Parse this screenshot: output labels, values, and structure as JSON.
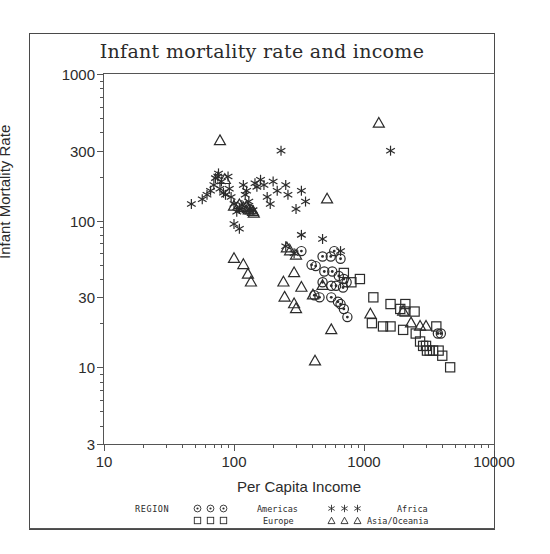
{
  "chart_data": {
    "type": "scatter",
    "title": "Infant mortality rate and income",
    "xlabel": "Per Capita Income",
    "ylabel": "Infant Mortality Rate",
    "xscale": "log",
    "yscale": "log",
    "xlim": [
      10,
      10000
    ],
    "ylim": [
      3,
      1000
    ],
    "xticks": [
      "10",
      "100",
      "1000",
      "10000"
    ],
    "xtick_values": [
      10,
      100,
      1000,
      10000
    ],
    "yticks": [
      "1000",
      "300",
      "100",
      "30",
      "10",
      "3"
    ],
    "ytick_values": [
      1000,
      300,
      100,
      30,
      10,
      3
    ],
    "grid": false,
    "legend_position": "below-axes",
    "legend_title": "REGION",
    "series": [
      {
        "name": "Americas",
        "marker": "circle-dot",
        "points": [
          [
            480,
            57
          ],
          [
            555,
            57
          ],
          [
            660,
            55
          ],
          [
            425,
            49
          ],
          [
            495,
            45
          ],
          [
            570,
            45
          ],
          [
            640,
            42
          ],
          [
            700,
            40
          ],
          [
            735,
            38
          ],
          [
            560,
            36
          ],
          [
            610,
            36
          ],
          [
            690,
            35
          ],
          [
            415,
            31
          ],
          [
            455,
            30
          ],
          [
            560,
            30
          ],
          [
            630,
            28
          ],
          [
            660,
            27
          ],
          [
            700,
            25
          ],
          [
            745,
            22
          ],
          [
            3700,
            17
          ],
          [
            3900,
            17
          ],
          [
            330,
            62
          ],
          [
            395,
            50
          ],
          [
            480,
            38
          ],
          [
            590,
            62
          ]
        ]
      },
      {
        "name": "Europe",
        "marker": "square",
        "points": [
          [
            1180,
            30
          ],
          [
            1600,
            27
          ],
          [
            1900,
            25
          ],
          [
            2050,
            24
          ],
          [
            2450,
            24
          ],
          [
            1400,
            19
          ],
          [
            1600,
            19
          ],
          [
            2000,
            18
          ],
          [
            2500,
            17
          ],
          [
            2700,
            15
          ],
          [
            2850,
            14
          ],
          [
            3000,
            14
          ],
          [
            3050,
            13
          ],
          [
            3200,
            13
          ],
          [
            3400,
            13
          ],
          [
            3600,
            19
          ],
          [
            3750,
            13
          ],
          [
            4000,
            12
          ],
          [
            4600,
            10
          ],
          [
            1150,
            20
          ],
          [
            2080,
            27
          ],
          [
            700,
            44
          ],
          [
            800,
            38
          ],
          [
            930,
            40
          ]
        ]
      },
      {
        "name": "Africa",
        "marker": "asterisk",
        "points": [
          [
            47,
            130
          ],
          [
            57,
            140
          ],
          [
            62,
            150
          ],
          [
            66,
            160
          ],
          [
            70,
            175
          ],
          [
            72,
            195
          ],
          [
            75,
            200
          ],
          [
            76,
            210
          ],
          [
            78,
            165
          ],
          [
            80,
            185
          ],
          [
            83,
            155
          ],
          [
            86,
            150
          ],
          [
            90,
            200
          ],
          [
            92,
            165
          ],
          [
            95,
            145
          ],
          [
            100,
            130
          ],
          [
            105,
            115
          ],
          [
            110,
            120
          ],
          [
            115,
            128
          ],
          [
            118,
            175
          ],
          [
            122,
            150
          ],
          [
            125,
            160
          ],
          [
            130,
            135
          ],
          [
            132,
            120
          ],
          [
            140,
            118
          ],
          [
            145,
            180
          ],
          [
            150,
            170
          ],
          [
            160,
            190
          ],
          [
            170,
            175
          ],
          [
            180,
            145
          ],
          [
            190,
            130
          ],
          [
            200,
            185
          ],
          [
            215,
            160
          ],
          [
            230,
            300
          ],
          [
            250,
            175
          ],
          [
            260,
            150
          ],
          [
            300,
            120
          ],
          [
            330,
            160
          ],
          [
            355,
            135
          ],
          [
            250,
            67
          ],
          [
            290,
            60
          ],
          [
            330,
            80
          ],
          [
            480,
            75
          ],
          [
            660,
            62
          ],
          [
            1600,
            300
          ],
          [
            100,
            95
          ],
          [
            110,
            88
          ]
        ]
      },
      {
        "name": "Asia/Oceania",
        "marker": "triangle",
        "points": [
          [
            78,
            350
          ],
          [
            85,
            190
          ],
          [
            100,
            125
          ],
          [
            110,
            128
          ],
          [
            118,
            122
          ],
          [
            125,
            125
          ],
          [
            128,
            120
          ],
          [
            130,
            118
          ],
          [
            135,
            118
          ],
          [
            140,
            115
          ],
          [
            142,
            112
          ],
          [
            100,
            55
          ],
          [
            118,
            50
          ],
          [
            128,
            43
          ],
          [
            135,
            38
          ],
          [
            255,
            65
          ],
          [
            270,
            62
          ],
          [
            300,
            58
          ],
          [
            240,
            38
          ],
          [
            290,
            44
          ],
          [
            330,
            35
          ],
          [
            245,
            30
          ],
          [
            290,
            27
          ],
          [
            300,
            25
          ],
          [
            405,
            31
          ],
          [
            480,
            36
          ],
          [
            520,
            140
          ],
          [
            1300,
            460
          ],
          [
            560,
            18
          ],
          [
            420,
            11
          ],
          [
            1120,
            23
          ],
          [
            2000,
            24
          ],
          [
            2300,
            20
          ],
          [
            2700,
            19
          ],
          [
            3000,
            19
          ]
        ]
      }
    ]
  },
  "legend": {
    "title": "REGION",
    "entries": [
      {
        "symbol": "circle-dot",
        "label": "Americas"
      },
      {
        "symbol": "square",
        "label": "Europe"
      },
      {
        "symbol": "asterisk",
        "label": "Africa"
      },
      {
        "symbol": "triangle",
        "label": "Asia/Oceania"
      }
    ]
  },
  "colors": {
    "ink": "#2b2b2b",
    "axis": "#555555",
    "background": "#ffffff"
  }
}
